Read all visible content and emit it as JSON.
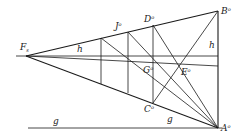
{
  "diagram": {
    "stroke_color": "#1a1a1a",
    "background": "#ffffff",
    "points": {
      "Fs": {
        "label": "F",
        "sub": "s",
        "x": 26,
        "y": 56
      },
      "B": {
        "label": "B",
        "sup": "o",
        "x": 218,
        "y": 11
      },
      "A": {
        "label": "A",
        "sup": "o",
        "x": 218,
        "y": 128
      },
      "D": {
        "label": "D",
        "sup": "o",
        "x": 153,
        "y": 25
      },
      "C": {
        "label": "C",
        "sup": "o",
        "x": 153,
        "y": 103
      },
      "J": {
        "label": "J",
        "sup": "o",
        "x": 128,
        "y": 32
      },
      "G": {
        "label": "G",
        "sup": "o",
        "x": 153,
        "y": 70
      },
      "E": {
        "label": "E",
        "sup": "o",
        "x": 180,
        "y": 62
      }
    },
    "line_labels": {
      "h_left": "h",
      "h_right": "h",
      "g_left": "g",
      "g_right": "g"
    }
  }
}
